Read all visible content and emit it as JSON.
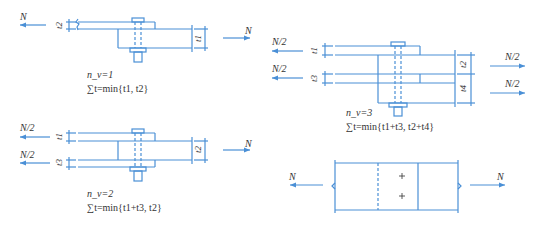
{
  "colors": {
    "line": "#4a8fd6",
    "text": "#333333"
  },
  "diagram1": {
    "force_left": "N",
    "force_right": "N",
    "dim_top": "t2",
    "dim_right": "t1",
    "nv": "n_v=1",
    "formula": "∑t=min{t1, t2}"
  },
  "diagram2": {
    "force_left_top": "N/2",
    "force_left_bottom": "N/2",
    "force_right": "N",
    "dim_left_top": "t1",
    "dim_left_bottom": "t3",
    "dim_right": "t2",
    "nv": "n_v=2",
    "formula": "∑t=min{t1+t3, t2}"
  },
  "diagram3": {
    "force_left_top": "N/2",
    "force_left_bottom": "N/2",
    "force_right_top": "N/2",
    "force_right_bottom": "N/2",
    "dim_left_top": "t1",
    "dim_left_bottom": "t3",
    "dim_right_top": "t2",
    "dim_right_bottom": "t4",
    "nv": "n_v=3",
    "formula": "∑t=min{t1+t3, t2+t4}"
  },
  "diagram4": {
    "force_left": "N",
    "force_right": "N",
    "bolt_marks": [
      "+",
      "+"
    ]
  }
}
